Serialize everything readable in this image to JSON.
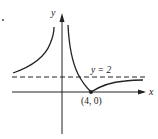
{
  "diagram": {
    "marker": ".",
    "axes": {
      "x_label": "x",
      "y_label": "y"
    },
    "asymptote": {
      "label": "y = 2",
      "style": "dashed"
    },
    "point": {
      "label": "(4, 0)",
      "x": 4,
      "y": 0
    },
    "colors": {
      "ink": "#222222",
      "background": "#ffffff"
    }
  }
}
